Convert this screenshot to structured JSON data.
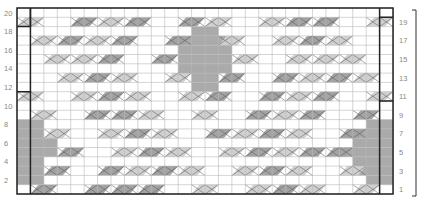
{
  "chart": {
    "columns": 28,
    "rows": 20,
    "grid": {
      "left": 17,
      "top": 8,
      "cell_w": 13.43,
      "cell_h": 9.3
    },
    "colors": {
      "grid": "#b8b8b8",
      "border": "#222222",
      "light": "#d0d0d0",
      "dark": "#a3a3a3",
      "fill": "#aaaaaa"
    },
    "left_labels": [
      "2",
      "4",
      "6",
      "8",
      "10",
      "12",
      "14",
      "16",
      "18",
      "20"
    ],
    "right_labels": [
      "1",
      "3",
      "5",
      "7",
      "9",
      "11",
      "13",
      "15",
      "17",
      "19"
    ],
    "rows_data": {
      "19": [
        [
          1,
          2,
          "l"
        ],
        [
          5,
          2,
          "d"
        ],
        [
          7,
          2,
          "l"
        ],
        [
          9,
          2,
          "d"
        ],
        [
          13,
          2,
          "d"
        ],
        [
          15,
          2,
          "l"
        ],
        [
          19,
          2,
          "l"
        ],
        [
          21,
          2,
          "d"
        ],
        [
          23,
          2,
          "d"
        ],
        [
          27,
          2,
          "l"
        ]
      ],
      "17": [
        [
          2,
          2,
          "l"
        ],
        [
          4,
          2,
          "d"
        ],
        [
          6,
          2,
          "l"
        ],
        [
          8,
          2,
          "d"
        ],
        [
          12,
          2,
          "d"
        ],
        [
          16,
          2,
          "l"
        ],
        [
          20,
          2,
          "l"
        ],
        [
          22,
          2,
          "d"
        ],
        [
          24,
          2,
          "l"
        ]
      ],
      "15": [
        [
          3,
          2,
          "l"
        ],
        [
          5,
          2,
          "l"
        ],
        [
          7,
          2,
          "d"
        ],
        [
          11,
          2,
          "d"
        ],
        [
          17,
          2,
          "l"
        ],
        [
          21,
          2,
          "l"
        ],
        [
          23,
          2,
          "l"
        ],
        [
          25,
          2,
          "l"
        ]
      ],
      "13": [
        [
          4,
          2,
          "l"
        ],
        [
          6,
          2,
          "d"
        ],
        [
          8,
          2,
          "l"
        ],
        [
          12,
          2,
          "l"
        ],
        [
          16,
          2,
          "d"
        ],
        [
          20,
          2,
          "d"
        ],
        [
          22,
          2,
          "l"
        ],
        [
          24,
          2,
          "d"
        ],
        [
          26,
          2,
          "l"
        ]
      ],
      "11": [
        [
          1,
          2,
          "l"
        ],
        [
          5,
          2,
          "l"
        ],
        [
          7,
          2,
          "d"
        ],
        [
          9,
          2,
          "l"
        ],
        [
          13,
          2,
          "l"
        ],
        [
          15,
          2,
          "d"
        ],
        [
          19,
          2,
          "d"
        ],
        [
          21,
          2,
          "l"
        ],
        [
          23,
          2,
          "d"
        ],
        [
          27,
          2,
          "l"
        ]
      ],
      "9": [
        [
          2,
          2,
          "l"
        ],
        [
          6,
          2,
          "d"
        ],
        [
          8,
          2,
          "d"
        ],
        [
          10,
          2,
          "l"
        ],
        [
          14,
          2,
          "l"
        ],
        [
          18,
          2,
          "d"
        ],
        [
          20,
          2,
          "l"
        ],
        [
          22,
          2,
          "d"
        ],
        [
          26,
          2,
          "d"
        ]
      ],
      "7": [
        [
          3,
          2,
          "l"
        ],
        [
          7,
          2,
          "l"
        ],
        [
          9,
          2,
          "d"
        ],
        [
          11,
          2,
          "l"
        ],
        [
          15,
          2,
          "d"
        ],
        [
          17,
          2,
          "l"
        ],
        [
          19,
          2,
          "d"
        ],
        [
          21,
          2,
          "l"
        ],
        [
          25,
          2,
          "d"
        ]
      ],
      "5": [
        [
          4,
          2,
          "d"
        ],
        [
          8,
          2,
          "l"
        ],
        [
          10,
          2,
          "d"
        ],
        [
          12,
          2,
          "l"
        ],
        [
          16,
          2,
          "l"
        ],
        [
          18,
          2,
          "d"
        ],
        [
          20,
          2,
          "l"
        ],
        [
          22,
          2,
          "d"
        ],
        [
          24,
          2,
          "d"
        ]
      ],
      "3": [
        [
          3,
          2,
          "d"
        ],
        [
          7,
          2,
          "d"
        ],
        [
          9,
          2,
          "l"
        ],
        [
          11,
          2,
          "d"
        ],
        [
          13,
          2,
          "l"
        ],
        [
          17,
          2,
          "l"
        ],
        [
          19,
          2,
          "d"
        ],
        [
          21,
          2,
          "l"
        ],
        [
          25,
          2,
          "l"
        ]
      ],
      "1": [
        [
          2,
          2,
          "d"
        ],
        [
          6,
          2,
          "d"
        ],
        [
          8,
          2,
          "d"
        ],
        [
          10,
          2,
          "d"
        ],
        [
          14,
          2,
          "l"
        ],
        [
          18,
          2,
          "l"
        ],
        [
          20,
          2,
          "d"
        ],
        [
          22,
          2,
          "l"
        ],
        [
          26,
          2,
          "l"
        ]
      ]
    },
    "fills": [
      [
        14,
        18,
        2,
        1
      ],
      [
        13,
        17,
        4,
        1
      ],
      [
        13,
        16,
        4,
        1
      ],
      [
        13,
        15,
        4,
        1
      ],
      [
        13,
        14,
        4,
        1
      ],
      [
        14,
        13,
        2,
        1
      ],
      [
        14,
        12,
        2,
        1
      ],
      [
        1,
        8,
        2,
        1
      ],
      [
        1,
        7,
        2,
        1
      ],
      [
        1,
        6,
        3,
        1
      ],
      [
        1,
        5,
        3,
        1
      ],
      [
        1,
        4,
        2,
        1
      ],
      [
        1,
        3,
        2,
        1
      ],
      [
        1,
        2,
        2,
        1
      ],
      [
        27,
        8,
        2,
        1
      ],
      [
        26,
        7,
        3,
        1
      ],
      [
        26,
        6,
        3,
        1
      ],
      [
        25,
        5,
        4,
        1
      ],
      [
        26,
        4,
        3,
        1
      ],
      [
        26,
        3,
        3,
        1
      ],
      [
        27,
        2,
        2,
        1
      ]
    ]
  }
}
